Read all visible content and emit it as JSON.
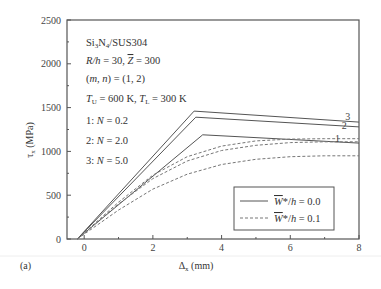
{
  "panel_label": "(a)",
  "chart_data": {
    "type": "line",
    "title": "",
    "xlabel": "Δx (mm)",
    "ylabel": "τx (MPa)",
    "xlim": [
      -0.5,
      8
    ],
    "ylim": [
      0,
      2500
    ],
    "xticks": [
      0,
      2,
      4,
      6,
      8
    ],
    "yticks": [
      0,
      500,
      1000,
      1500,
      2000,
      2500
    ],
    "grid": false,
    "legend_position": "lower right",
    "legend": [
      {
        "label": "W̄*/h = 0.0",
        "style": "solid"
      },
      {
        "label": "W̄*/h = 0.1",
        "style": "dashed"
      }
    ],
    "annotations": [
      "Si3N4/SUS304",
      "R/h = 30, Z̄ = 300",
      "(m, n) = (1, 2)",
      "TU = 600 K, TL = 300 K",
      "1: N = 0.2",
      "2: N = 2.0",
      "3: N = 5.0"
    ],
    "series": [
      {
        "name": "1 (N=0.2), W*/h=0.0",
        "style": "solid",
        "x": [
          -0.2,
          3.45,
          8.0
        ],
        "y": [
          0,
          1190,
          1095
        ]
      },
      {
        "name": "2 (N=2.0), W*/h=0.0",
        "style": "solid",
        "x": [
          -0.2,
          3.25,
          8.0
        ],
        "y": [
          0,
          1390,
          1280
        ]
      },
      {
        "name": "3 (N=5.0), W*/h=0.0",
        "style": "solid",
        "x": [
          -0.2,
          3.2,
          8.0
        ],
        "y": [
          0,
          1460,
          1335
        ]
      },
      {
        "name": "1 (N=0.2), W*/h=0.1",
        "style": "dashed",
        "x": [
          -0.2,
          1,
          2,
          3,
          4,
          5,
          6,
          7,
          8
        ],
        "y": [
          0,
          330,
          570,
          740,
          850,
          910,
          940,
          950,
          950
        ]
      },
      {
        "name": "2 (N=2.0), W*/h=0.1",
        "style": "dashed",
        "x": [
          -0.2,
          1,
          2,
          3,
          4,
          5,
          6,
          7,
          8
        ],
        "y": [
          0,
          400,
          690,
          890,
          1010,
          1070,
          1100,
          1110,
          1110
        ]
      },
      {
        "name": "3 (N=5.0), W*/h=0.1",
        "style": "dashed",
        "x": [
          -0.2,
          1,
          2,
          3,
          4,
          5,
          6,
          7,
          8
        ],
        "y": [
          0,
          420,
          730,
          940,
          1060,
          1120,
          1140,
          1145,
          1145
        ]
      }
    ],
    "curve_labels": [
      {
        "text": "1",
        "x": 7.3,
        "y": 1110
      },
      {
        "text": "2",
        "x": 7.5,
        "y": 1260
      },
      {
        "text": "3",
        "x": 7.6,
        "y": 1355
      }
    ]
  }
}
